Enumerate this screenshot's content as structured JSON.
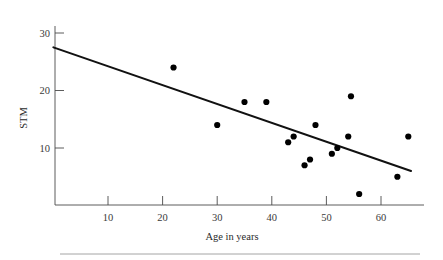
{
  "figure": {
    "footer_rule": true
  },
  "chart_data": {
    "type": "scatter",
    "title": "",
    "xlabel": "Age in years",
    "ylabel": "STM",
    "xlim": [
      0,
      68
    ],
    "ylim": [
      0,
      32
    ],
    "xticks": [
      10,
      20,
      30,
      40,
      50,
      60
    ],
    "xtick_labels": [
      "10",
      "20",
      "30",
      "40",
      "50",
      "60"
    ],
    "yticks": [
      10,
      20,
      30
    ],
    "ytick_labels": [
      "10",
      "20",
      "30"
    ],
    "grid": false,
    "legend": "none",
    "marker": "filled-circle",
    "marker_color": "#000000",
    "points": [
      {
        "x": 22,
        "y": 24
      },
      {
        "x": 30,
        "y": 14
      },
      {
        "x": 35,
        "y": 18
      },
      {
        "x": 39,
        "y": 18
      },
      {
        "x": 43,
        "y": 11
      },
      {
        "x": 44,
        "y": 12
      },
      {
        "x": 46,
        "y": 7
      },
      {
        "x": 47,
        "y": 8
      },
      {
        "x": 48,
        "y": 14
      },
      {
        "x": 51,
        "y": 9
      },
      {
        "x": 52,
        "y": 10
      },
      {
        "x": 54,
        "y": 12
      },
      {
        "x": 54.5,
        "y": 19
      },
      {
        "x": 56,
        "y": 2
      },
      {
        "x": 63,
        "y": 5
      },
      {
        "x": 65,
        "y": 12
      }
    ],
    "fit_line": {
      "label": "regression line",
      "color": "#111111",
      "x_start": 0,
      "y_start": 27.5,
      "x_end": 65.5,
      "y_end": 6
    }
  }
}
